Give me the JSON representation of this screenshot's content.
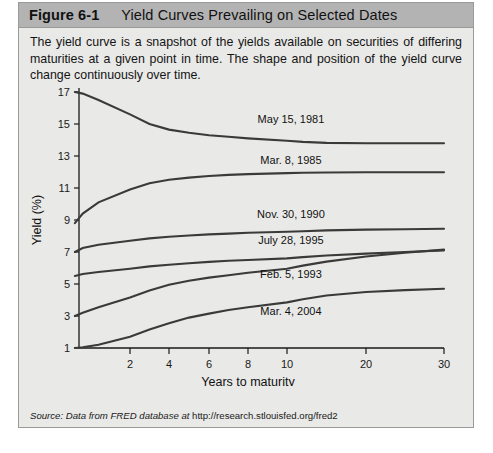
{
  "figure": {
    "number": "Figure 6-1",
    "title": "Yield Curves Prevailing on Selected Dates",
    "caption": "The yield curve is a snapshot of the yields available on securities of differing maturities at a given point in time. The shape and position of the yield curve change continuously over time.",
    "source_prefix": "Source: Data from FRED database at ",
    "source_url": "http://research.stlouisfed.org/fred2"
  },
  "colors": {
    "header_bar": "#b3b3b3",
    "panel_background": "#e9e9e7",
    "curve": "#3a3a3a",
    "axis": "#1a1a1a",
    "border": "#9a9a98"
  },
  "chart_data": {
    "type": "line",
    "title": "Yield Curves Prevailing on Selected Dates",
    "xlabel": "Years to maturity",
    "ylabel": "Yield (%)",
    "grid": false,
    "legend_position": "inline-labels",
    "x_scale": "compressed-nonlinear",
    "xticks": [
      2,
      4,
      6,
      8,
      10,
      20,
      30
    ],
    "xtick_labels": [
      "2",
      "4",
      "6",
      "8",
      "10",
      "20",
      "30"
    ],
    "yticks": [
      1,
      3,
      5,
      7,
      9,
      11,
      13,
      15,
      17
    ],
    "ytick_labels": [
      "1",
      "3",
      "5",
      "7",
      "9",
      "11",
      "13",
      "15",
      "17"
    ],
    "ylim": [
      1,
      17
    ],
    "xlim": [
      0.25,
      30
    ],
    "series": [
      {
        "name": "May 15, 1981",
        "label_x": 10.5,
        "label_y": 15.3,
        "x": [
          0.25,
          0.5,
          1,
          2,
          3,
          4,
          5,
          6,
          7,
          8,
          10,
          12,
          15,
          20,
          25,
          30
        ],
        "y": [
          17.0,
          16.9,
          16.5,
          15.6,
          15.0,
          14.65,
          14.45,
          14.3,
          14.2,
          14.1,
          13.95,
          13.88,
          13.82,
          13.8,
          13.8,
          13.8
        ]
      },
      {
        "name": "Mar. 8, 1985",
        "label_x": 10.5,
        "label_y": 12.75,
        "x": [
          0.25,
          0.5,
          1,
          2,
          3,
          4,
          5,
          6,
          7,
          8,
          10,
          12,
          15,
          20,
          25,
          30
        ],
        "y": [
          8.8,
          9.4,
          10.1,
          10.9,
          11.3,
          11.52,
          11.65,
          11.75,
          11.82,
          11.87,
          11.93,
          11.95,
          11.97,
          11.98,
          11.98,
          11.98
        ]
      },
      {
        "name": "Nov. 30, 1990",
        "label_x": 10.5,
        "label_y": 9.35,
        "x": [
          0.25,
          0.5,
          1,
          2,
          3,
          4,
          5,
          6,
          7,
          8,
          10,
          12,
          15,
          20,
          25,
          30
        ],
        "y": [
          7.0,
          7.25,
          7.45,
          7.7,
          7.85,
          7.95,
          8.03,
          8.1,
          8.15,
          8.2,
          8.27,
          8.3,
          8.35,
          8.4,
          8.42,
          8.45
        ]
      },
      {
        "name": "July 28, 1995",
        "label_x": 10.5,
        "label_y": 7.75,
        "x": [
          0.25,
          0.5,
          1,
          2,
          3,
          4,
          5,
          6,
          7,
          8,
          10,
          12,
          15,
          20,
          25,
          30
        ],
        "y": [
          5.5,
          5.62,
          5.75,
          5.95,
          6.1,
          6.2,
          6.3,
          6.38,
          6.45,
          6.5,
          6.6,
          6.68,
          6.78,
          6.9,
          7.0,
          7.1
        ]
      },
      {
        "name": "Feb. 5, 1993",
        "label_x": 10.5,
        "label_y": 5.6,
        "x": [
          0.25,
          0.5,
          1,
          2,
          3,
          4,
          5,
          6,
          7,
          8,
          10,
          12,
          15,
          20,
          25,
          30
        ],
        "y": [
          3.0,
          3.2,
          3.55,
          4.15,
          4.6,
          4.95,
          5.2,
          5.4,
          5.55,
          5.7,
          5.95,
          6.15,
          6.4,
          6.72,
          6.95,
          7.15
        ]
      },
      {
        "name": "Mar. 4, 2004",
        "label_x": 10.5,
        "label_y": 3.3,
        "x": [
          0.25,
          0.5,
          1,
          2,
          3,
          4,
          5,
          6,
          7,
          8,
          10,
          12,
          15,
          20,
          25,
          30
        ],
        "y": [
          1.0,
          1.05,
          1.2,
          1.7,
          2.15,
          2.55,
          2.9,
          3.15,
          3.38,
          3.55,
          3.85,
          4.05,
          4.28,
          4.5,
          4.62,
          4.7
        ]
      }
    ]
  }
}
